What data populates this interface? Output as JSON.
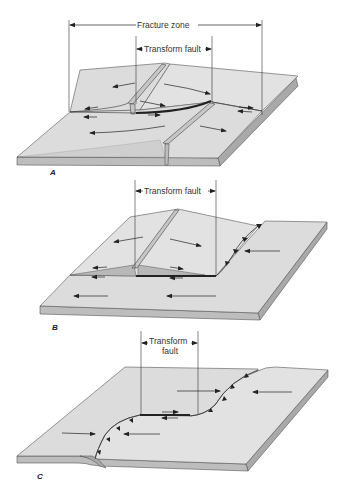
{
  "figure": {
    "panel_a": {
      "label": "A",
      "fracture_zone_label": "Fracture zone",
      "transform_fault_label": "Transform fault",
      "description": "Transform fault offsetting two mid-ocean ridge segments; fracture zone extends beyond the transform"
    },
    "panel_b": {
      "label": "B",
      "transform_fault_label": "Transform fault",
      "description": "Transform fault connecting a ridge to a trench (subduction zone)"
    },
    "panel_c": {
      "label": "C",
      "transform_fault_label_line1": "Transform",
      "transform_fault_label_line2": "fault",
      "description": "Transform fault connecting two trench segments"
    },
    "colors": {
      "plate_top": "#dcdcdc",
      "plate_side": "#a9a9a9",
      "plate_front": "#bdbdbd",
      "line": "#333333",
      "background": "#ffffff"
    }
  }
}
